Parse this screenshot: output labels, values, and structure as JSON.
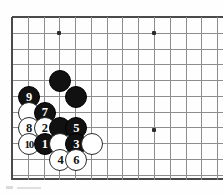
{
  "diagram": {
    "kind": "go-board-diagram",
    "title": "",
    "board": {
      "left": 12,
      "top": 17,
      "spacing": 15.78,
      "cols": 14,
      "rows": 11,
      "bottom_edge_y": 178,
      "line_color": "#8d8d8d",
      "edge_color": "#4a4a4a",
      "background": "#fefefe"
    },
    "star_points": [
      {
        "col": 4,
        "row": 2,
        "x": 59,
        "y": 33
      },
      {
        "col": 10,
        "row": 2,
        "x": 154,
        "y": 33
      },
      {
        "col": 10,
        "row": 8,
        "x": 154,
        "y": 130
      }
    ],
    "stones": [
      {
        "id": "b-d5",
        "color": "black",
        "label": "",
        "col": 4,
        "row": 5
      },
      {
        "id": "b-e6",
        "color": "black",
        "label": "",
        "col": 5,
        "row": 6
      },
      {
        "id": "b-9",
        "color": "black",
        "label": "9",
        "col": 2,
        "row": 6
      },
      {
        "id": "w-b7",
        "color": "white",
        "label": "",
        "col": 2,
        "row": 7
      },
      {
        "id": "b-7",
        "color": "black",
        "label": "7",
        "col": 3,
        "row": 7
      },
      {
        "id": "w-8",
        "color": "white",
        "label": "8",
        "col": 2,
        "row": 8
      },
      {
        "id": "w-2",
        "color": "white",
        "label": "2",
        "col": 3,
        "row": 8
      },
      {
        "id": "b-d8",
        "color": "black",
        "label": "",
        "col": 4,
        "row": 8
      },
      {
        "id": "b-5",
        "color": "black",
        "label": "5",
        "col": 5,
        "row": 8
      },
      {
        "id": "w-10",
        "color": "white",
        "label": "10",
        "col": 2,
        "row": 9
      },
      {
        "id": "b-1",
        "color": "black",
        "label": "1",
        "col": 3,
        "row": 9
      },
      {
        "id": "w-d9",
        "color": "white",
        "label": "",
        "col": 4,
        "row": 9
      },
      {
        "id": "b-3",
        "color": "black",
        "label": "3",
        "col": 5,
        "row": 9
      },
      {
        "id": "w-f9",
        "color": "white",
        "label": "",
        "col": 6,
        "row": 9
      },
      {
        "id": "w-4",
        "color": "white",
        "label": "4",
        "col": 4,
        "row": 10
      },
      {
        "id": "w-6",
        "color": "white",
        "label": "6",
        "col": 5,
        "row": 10
      }
    ],
    "move_sequence": [
      "1",
      "2",
      "3",
      "4",
      "5",
      "6",
      "7",
      "8",
      "9",
      "10"
    ],
    "colors": {
      "black_stone": "#111111",
      "white_stone": "#ffffff",
      "label_on_black": "#ffffff",
      "label_on_white": "#111111"
    }
  }
}
